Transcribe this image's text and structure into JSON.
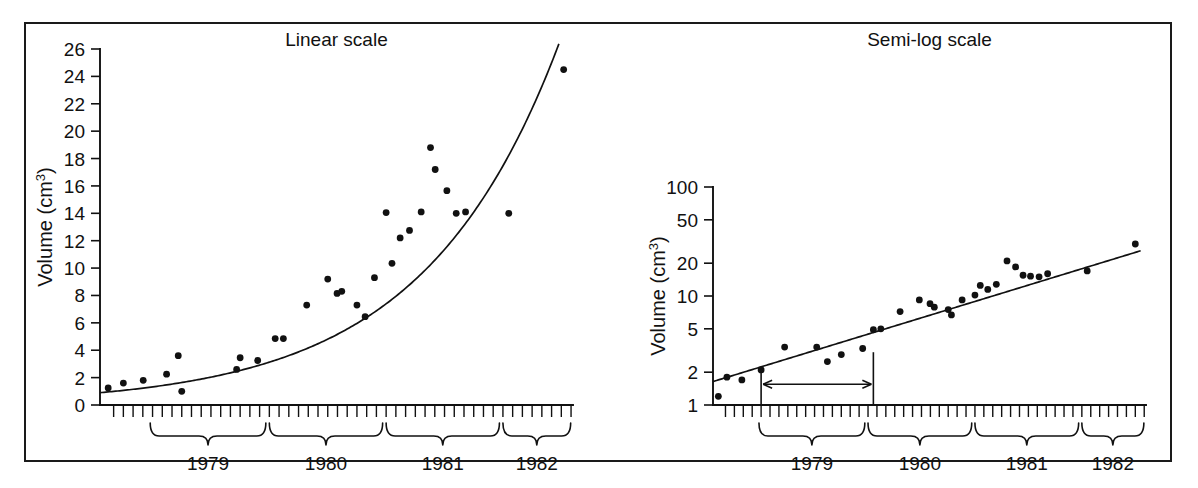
{
  "figure": {
    "background_color": "#ffffff",
    "ink_color": "#111111",
    "panels": [
      "linear",
      "semilog"
    ]
  },
  "chart_data": [
    {
      "type": "scatter",
      "id": "linear",
      "title": "Linear scale",
      "xlabel": "",
      "ylabel": "Volume (cm3)",
      "ylabel_base": "Volume (cm",
      "ylabel_exponent": "3",
      "ylabel_close": ")",
      "yscale": "linear",
      "ylim": [
        0,
        26
      ],
      "yticks": [
        0,
        2,
        4,
        6,
        8,
        10,
        12,
        14,
        16,
        18,
        20,
        22,
        24,
        26
      ],
      "ytick_labels": [
        "0",
        "2",
        "4",
        "6",
        "8",
        "10",
        "12",
        "14",
        "16",
        "18",
        "20",
        "22",
        "24",
        "26"
      ],
      "xlim": [
        1978.55,
        1982.6
      ],
      "x_minor_tick_interval_months": 1,
      "grid": false,
      "legend": null,
      "x_group_labels": [
        "1979",
        "1980",
        "1981",
        "1982"
      ],
      "x_group_ranges": [
        [
          1978.98,
          1979.97
        ],
        [
          1980.0,
          1980.97
        ],
        [
          1981.0,
          1981.97
        ],
        [
          1982.0,
          1982.58
        ]
      ],
      "x": [
        1978.62,
        1978.75,
        1978.92,
        1979.12,
        1979.22,
        1979.25,
        1979.72,
        1979.75,
        1979.9,
        1980.05,
        1980.12,
        1980.32,
        1980.5,
        1980.58,
        1980.62,
        1980.75,
        1980.82,
        1980.9,
        1981.0,
        1981.05,
        1981.12,
        1981.2,
        1981.3,
        1981.38,
        1981.42,
        1981.52,
        1981.6,
        1981.68,
        1982.05,
        1982.52
      ],
      "y": [
        1.25,
        1.6,
        1.8,
        2.25,
        3.6,
        1.0,
        2.6,
        3.45,
        3.25,
        4.85,
        4.85,
        7.3,
        9.2,
        8.15,
        8.3,
        7.3,
        6.45,
        9.3,
        14.05,
        10.35,
        12.2,
        12.75,
        14.1,
        18.8,
        17.2,
        15.65,
        14.0,
        14.1,
        14.0,
        24.5
      ],
      "fit": {
        "model": "exponential",
        "equation": "y = a * exp(b * (x - 1978))",
        "a": 0.56,
        "b": 0.86,
        "x_start": 1978.55,
        "x_end": 1982.58
      }
    },
    {
      "type": "scatter",
      "id": "semilog",
      "title": "Semi-log scale",
      "xlabel": "",
      "ylabel": "Volume (cm3)",
      "ylabel_base": "Volume (cm",
      "ylabel_exponent": "3",
      "ylabel_close": ")",
      "yscale": "log",
      "ylim": [
        1,
        100
      ],
      "yticks": [
        1,
        2,
        5,
        10,
        20,
        50,
        100
      ],
      "ytick_labels": [
        "1",
        "2",
        "5",
        "10",
        "20",
        "50",
        "100"
      ],
      "xlim": [
        1978.55,
        1982.6
      ],
      "x_minor_tick_interval_months": 1,
      "grid": false,
      "legend": null,
      "x_group_labels": [
        "1979",
        "1980",
        "1981",
        "1982"
      ],
      "x_group_ranges": [
        [
          1978.98,
          1979.97
        ],
        [
          1980.0,
          1980.97
        ],
        [
          1981.0,
          1981.97
        ],
        [
          1982.0,
          1982.58
        ]
      ],
      "x": [
        1978.6,
        1978.68,
        1978.82,
        1979.0,
        1979.22,
        1979.52,
        1979.62,
        1979.75,
        1979.95,
        1980.05,
        1980.12,
        1980.3,
        1980.48,
        1980.58,
        1980.62,
        1980.75,
        1980.78,
        1980.88,
        1981.0,
        1981.05,
        1981.12,
        1981.2,
        1981.3,
        1981.38,
        1981.45,
        1981.52,
        1981.6,
        1981.68,
        1982.05,
        1982.5
      ],
      "y": [
        1.2,
        1.8,
        1.7,
        2.1,
        3.4,
        3.4,
        2.5,
        2.9,
        3.3,
        4.9,
        5.0,
        7.2,
        9.2,
        8.5,
        7.9,
        7.5,
        6.7,
        9.2,
        10.2,
        12.5,
        11.5,
        12.8,
        21.0,
        18.5,
        15.5,
        15.2,
        15.0,
        16.0,
        17.0,
        30.0
      ],
      "fit": {
        "model": "log-linear",
        "equation": "log10(y) = m * (x - 1978) + c",
        "m": 0.3,
        "c": 0.05,
        "x_start": 1978.55,
        "x_end": 1982.55
      },
      "annotation": {
        "name": "doubling-time-arrow",
        "kind": "double-headed-arrow",
        "description": "Horizontal double-headed arrow between two vertical drop lines marking the doubling time interval",
        "x_left": 1979.0,
        "x_right": 1980.05,
        "y_level": 1.55,
        "drop_line_top_left": 2.05,
        "drop_line_top_right": 3.05,
        "label": ""
      }
    }
  ]
}
